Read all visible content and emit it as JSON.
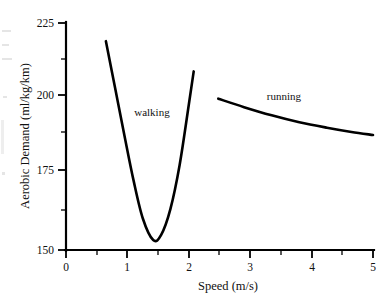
{
  "chart_data": {
    "type": "line",
    "title": "",
    "xlabel": "Speed (m/s)",
    "ylabel": "Aerobic Demand (ml/kg/km)",
    "xlim": [
      0,
      5
    ],
    "ylim": [
      150,
      225
    ],
    "grid": false,
    "legend_position": "inline-annotation",
    "x_ticks": [
      "0",
      "1",
      "2",
      "3",
      "4",
      "5"
    ],
    "x_tick_values": [
      0,
      1,
      2,
      3,
      4,
      5
    ],
    "x_minor_tick_values": [
      0.5,
      1.5,
      2.5,
      3.5,
      4.5
    ],
    "y_ticks": [
      "150",
      "175",
      "200",
      "225"
    ],
    "y_tick_values": [
      150,
      175,
      200,
      225
    ],
    "y_minor_tick_values": [
      162.5,
      187.5,
      212.5
    ],
    "series": [
      {
        "name": "walking",
        "label": "walking",
        "label_x": 1.4,
        "label_y": 194.3,
        "x": [
          0.65,
          0.8,
          0.95,
          1.1,
          1.25,
          1.42,
          1.55,
          1.7,
          1.85,
          2.0,
          2.08
        ],
        "y": [
          219.0,
          203.5,
          188.0,
          173.0,
          160.5,
          153.3,
          155.0,
          163.5,
          178.0,
          198.0,
          209.0
        ]
      },
      {
        "name": "running",
        "label": "running",
        "label_x": 3.55,
        "label_y": 199.5,
        "x": [
          2.48,
          2.9,
          3.35,
          3.8,
          4.25,
          4.65,
          5.0
        ],
        "y": [
          200.0,
          197.2,
          194.5,
          192.2,
          190.4,
          189.0,
          188.0
        ]
      }
    ]
  },
  "axes": {
    "x_title": "Speed (m/s)",
    "y_title": "Aerobic Demand (ml/kg/km)"
  },
  "labels": {
    "walking": "walking",
    "running": "running",
    "y_225": "225",
    "y_200": "200",
    "y_175": "175",
    "y_150": "150",
    "x_0": "0",
    "x_1": "1",
    "x_2": "2",
    "x_3": "3",
    "x_4": "4",
    "x_5": "5"
  }
}
